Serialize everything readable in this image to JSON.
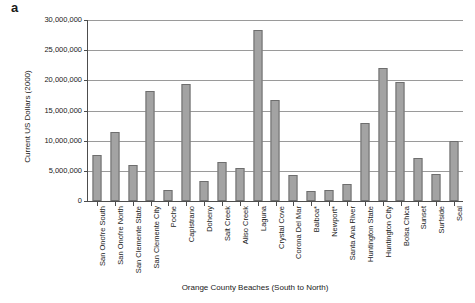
{
  "panel": {
    "letter": "a"
  },
  "chart_data": {
    "type": "bar",
    "title": "",
    "xlabel": "Orange County Beaches (South to North)",
    "ylabel": "Current US Dollars (2000)",
    "ylim": [
      0,
      30000000
    ],
    "ytick_step": 5000000,
    "grid": true,
    "legend": "none",
    "bar_color": "#a3a3a3",
    "bar_edge_color": "#6e6e6e",
    "axis_color": "#4d4d4d",
    "gridline_color": "#9a9a9a",
    "ytick_labels": [
      "0",
      "5,000,000",
      "10,000,000",
      "15,000,000",
      "20,000,000",
      "25,000,000",
      "30,000,000"
    ],
    "categories": [
      "San Onofre South",
      "San Onofre North",
      "San Clemente State",
      "San Clemente City",
      "Poche",
      "Capistrano",
      "Doheny",
      "Salt Creek",
      "Aliso Creek",
      "Laguna",
      "Crystal Cove",
      "Corona Del Mar",
      "Balboa*",
      "Newport*",
      "Santa Ana River",
      "Huntington State",
      "Huntington City",
      "Bolsa Chica",
      "Sunset",
      "Surfside",
      "Seal"
    ],
    "values": [
      7600000,
      11500000,
      6000000,
      18200000,
      1800000,
      19400000,
      3400000,
      6400000,
      5400000,
      28300000,
      16700000,
      4300000,
      1700000,
      1800000,
      2800000,
      13000000,
      22000000,
      19800000,
      7200000,
      4500000,
      10000000
    ]
  }
}
